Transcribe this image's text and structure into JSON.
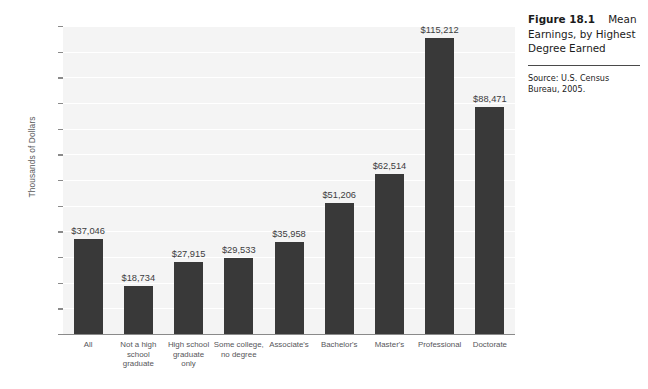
{
  "caption": {
    "figure_number": "Figure 18.1",
    "title": "Mean Earnings, by Highest Degree Earned",
    "source": "Source: U.S. Census Bureau, 2005."
  },
  "chart_data": {
    "type": "bar",
    "title": "Mean Earnings, by Highest Degree Earned",
    "xlabel": "",
    "ylabel": "Thousands of Dollars",
    "ylim": [
      0,
      120
    ],
    "yticks": [
      0,
      10,
      20,
      30,
      40,
      50,
      60,
      70,
      80,
      90,
      100,
      110,
      120
    ],
    "grid": true,
    "legend": "none",
    "bar_color": "#393939",
    "plot_background": "#f4f4f4",
    "categories": [
      "All",
      "Not a high school graduate",
      "High school graduate only",
      "Some college, no degree",
      "Associate's",
      "Bachelor's",
      "Master's",
      "Professional",
      "Doctorate"
    ],
    "category_lines": [
      [
        "All"
      ],
      [
        "Not a high",
        "school",
        "graduate"
      ],
      [
        "High school",
        "graduate",
        "only"
      ],
      [
        "Some college,",
        "no degree"
      ],
      [
        "Associate's"
      ],
      [
        "Bachelor's"
      ],
      [
        "Master's"
      ],
      [
        "Professional"
      ],
      [
        "Doctorate"
      ]
    ],
    "values": [
      37.046,
      18.734,
      27.915,
      29.533,
      35.958,
      51.206,
      62.514,
      115.212,
      88.471
    ],
    "data_labels": [
      "$37,046",
      "$18,734",
      "$27,915",
      "$29,533",
      "$35,958",
      "$51,206",
      "$62,514",
      "$115,212",
      "$88,471"
    ]
  }
}
